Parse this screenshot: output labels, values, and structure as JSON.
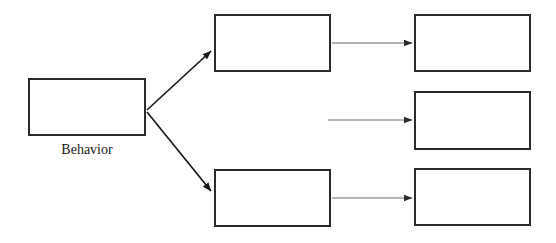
{
  "diagram": {
    "canvas": {
      "width": 556,
      "height": 243,
      "background": "#ffffff"
    },
    "style": {
      "box_border_color": "#2b2b2b",
      "box_fill_color": "#ffffff",
      "box_border_width": 2,
      "arrow_color": "#3a3a3a",
      "diagonal_arrow_color": "#1a1a1a",
      "caption_color": "#1a1a1a"
    },
    "nodes": [
      {
        "id": "behavior",
        "label": "",
        "caption": "Behavior",
        "x": 28,
        "y": 78,
        "width": 118,
        "height": 58,
        "column": "source"
      },
      {
        "id": "middle-top",
        "label": "",
        "caption": "",
        "x": 214,
        "y": 14,
        "width": 117,
        "height": 58,
        "column": "middle"
      },
      {
        "id": "middle-bottom",
        "label": "",
        "caption": "",
        "x": 214,
        "y": 169,
        "width": 117,
        "height": 58,
        "column": "middle"
      },
      {
        "id": "right-top",
        "label": "",
        "caption": "",
        "x": 414,
        "y": 14,
        "width": 117,
        "height": 58,
        "column": "right"
      },
      {
        "id": "right-middle",
        "label": "",
        "caption": "",
        "x": 414,
        "y": 91,
        "width": 117,
        "height": 59,
        "column": "right"
      },
      {
        "id": "right-bottom",
        "label": "",
        "caption": "",
        "x": 414,
        "y": 168,
        "width": 117,
        "height": 58,
        "column": "right"
      }
    ],
    "connectors": [
      {
        "id": "behavior-to-middle-top",
        "type": "diagonal",
        "from": "behavior",
        "to": "middle-top",
        "x1": 147,
        "y1": 110,
        "x2": 211,
        "y2": 51,
        "label": ""
      },
      {
        "id": "behavior-to-middle-bottom",
        "type": "diagonal",
        "from": "behavior",
        "to": "middle-bottom",
        "x1": 147,
        "y1": 112,
        "x2": 211,
        "y2": 191,
        "label": ""
      },
      {
        "id": "middle-top-to-right-top",
        "type": "horizontal",
        "from": "middle-top",
        "to": "right-top",
        "x1": 332,
        "y1": 43,
        "x2": 412,
        "y2": 43,
        "label": ""
      },
      {
        "id": "unattached-to-right-middle",
        "type": "horizontal",
        "from": null,
        "to": "right-middle",
        "x1": 328,
        "y1": 120,
        "x2": 412,
        "y2": 120,
        "label": ""
      },
      {
        "id": "middle-bottom-to-right-bottom",
        "type": "horizontal",
        "from": "middle-bottom",
        "to": "right-bottom",
        "x1": 332,
        "y1": 198,
        "x2": 412,
        "y2": 198,
        "label": ""
      }
    ]
  }
}
